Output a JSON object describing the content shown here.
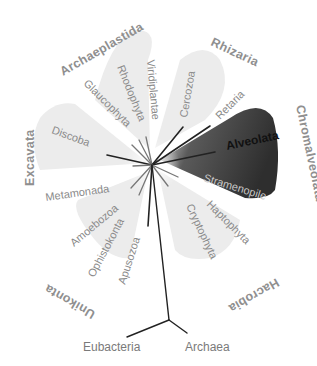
{
  "diagram": {
    "type": "unrooted eukaryote tree of life",
    "supergroups": [
      {
        "name": "Archaeplastida",
        "clades": [
          "Viridiplantae",
          "Rhodophyta",
          "Glaucophyta"
        ]
      },
      {
        "name": "Rhizaria",
        "clades": [
          "Cercozoa",
          "Retaria"
        ]
      },
      {
        "name": "Chromalveolata",
        "clades": [
          "Alveolata",
          "Stramenopile"
        ]
      },
      {
        "name": "Hacrobia",
        "clades": [
          "Haptophyta",
          "Cryptophyta"
        ]
      },
      {
        "name": "Unikonta",
        "clades": [
          "Amoebozoa",
          "Ophistokonta",
          "Apusozoa"
        ]
      },
      {
        "name": "Excavata",
        "clades": [
          "Discoba",
          "Metamonada"
        ]
      }
    ],
    "outgroups": [
      "Eubacteria",
      "Archaea"
    ],
    "highlighted_clade": "Alveolata",
    "colors": {
      "label": "#8a8a8a",
      "highlight_text": "#111111",
      "highlight_fill_dark": "#3c3c3c",
      "highlight_fill_light": "#e8e8e8",
      "group_fill": "#ececec",
      "branch": "#222222"
    }
  },
  "labels": {
    "archaeplastida": "Archaeplastida",
    "viridiplantae": "Viridiplantae",
    "rhodophyta": "Rhodophyta",
    "glaucophyta": "Glaucophyta",
    "rhizaria": "Rhizaria",
    "cercozoa": "Cercozoa",
    "retaria": "Retaria",
    "chromalveolata": "Chromalveolata",
    "alveolata": "Alveolata",
    "stramenopile": "Stramenopile",
    "hacrobia": "Hacrobia",
    "haptophyta": "Haptophyta",
    "cryptophyta": "Cryptophyta",
    "unikonta": "Unikonta",
    "amoebozoa": "Amoebozoa",
    "ophistokonta": "Ophistokonta",
    "apusozoa": "Apusozoa",
    "excavata": "Excavata",
    "discoba": "Discoba",
    "metamonada": "Metamonada",
    "eubacteria": "Eubacteria",
    "archaea": "Archaea"
  }
}
